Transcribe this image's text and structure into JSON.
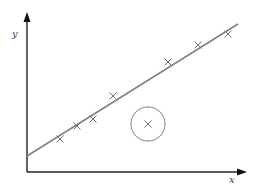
{
  "chart_data": {
    "type": "scatter",
    "title": "",
    "xlabel": "x",
    "ylabel": "y",
    "grid": false,
    "legend": null,
    "axis_ranges": {
      "x": [
        0,
        10
      ],
      "y": [
        0,
        10
      ]
    },
    "points_pixel": [
      {
        "x": 60,
        "y": 139
      },
      {
        "x": 77,
        "y": 126
      },
      {
        "x": 93,
        "y": 119
      },
      {
        "x": 113,
        "y": 96
      },
      {
        "x": 168,
        "y": 62
      },
      {
        "x": 198,
        "y": 45
      },
      {
        "x": 228,
        "y": 34
      }
    ],
    "points": [
      {
        "x": 1.5,
        "y": 2.1
      },
      {
        "x": 2.3,
        "y": 2.9
      },
      {
        "x": 3.0,
        "y": 3.4
      },
      {
        "x": 3.9,
        "y": 4.8
      },
      {
        "x": 6.5,
        "y": 7.0
      },
      {
        "x": 7.8,
        "y": 8.1
      },
      {
        "x": 9.2,
        "y": 8.8
      }
    ],
    "outlier": {
      "x": 5.6,
      "y": 3.1,
      "pixel": {
        "x": 148,
        "y": 124
      },
      "circled": true
    },
    "trend_line": {
      "from": {
        "x": 0,
        "y": 1.0
      },
      "to": {
        "x": 9.7,
        "y": 9.4
      }
    },
    "annotations": [
      "Outlier point circled, far below the line of best fit"
    ]
  },
  "labels": {
    "x_axis": "x",
    "y_axis": "y"
  },
  "colors": {
    "axis": "#222222",
    "line": "#808080",
    "marker": "#707070",
    "circle": "#808080"
  }
}
